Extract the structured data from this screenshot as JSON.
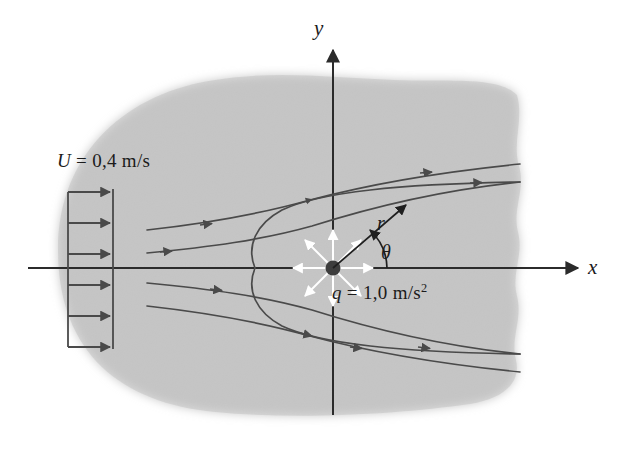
{
  "figure": {
    "kind": "rankine-half-body-potential-flow-diagram",
    "background_color": "#ffffff",
    "blob_color": "#c9c9c9",
    "line_color": "#4a4a4a",
    "axis_color": "#2b2b2b",
    "source_marker_color": "#3d3d3d",
    "source_arrow_color": "#ffffff"
  },
  "labels": {
    "freestream": "U = 0,4 m/s",
    "freestream_symbol": "U",
    "freestream_value": "0,4 m/s",
    "source_strength_symbol": "q",
    "source_strength_value": "1,0 m/s",
    "source_strength_exponent": "2",
    "x_axis": "x",
    "y_axis": "y",
    "radius": "r",
    "angle": "θ"
  },
  "chart_data": {
    "type": "line",
    "title": "",
    "xlabel": "x",
    "ylabel": "y",
    "annotations": [
      {
        "name": "freestream-velocity",
        "text": "U = 0,4 m/s",
        "x": 57,
        "y": 150
      },
      {
        "name": "source-strength",
        "text": "q = 1,0 m/s^2",
        "x": 332,
        "y": 281
      },
      {
        "name": "radial-coordinate",
        "text": "r",
        "x": 377,
        "y": 212
      },
      {
        "name": "angular-coordinate",
        "text": "θ",
        "x": 381,
        "y": 241
      }
    ],
    "origin": {
      "x": 333,
      "y": 268
    },
    "source_point": {
      "x": 333,
      "y": 268
    },
    "stagnation_point": {
      "x": 255,
      "y": 268
    },
    "axes": {
      "x_axis": {
        "x1": 28,
        "y1": 268,
        "x2": 580,
        "y2": 268,
        "arrow": "right"
      },
      "y_axis": {
        "x1": 333,
        "y1": 415,
        "x2": 333,
        "y2": 48,
        "arrow": "up"
      }
    },
    "velocity_profile": {
      "box": {
        "left": 68,
        "top": 188,
        "right": 114,
        "bottom": 350
      },
      "arrow_count": 6,
      "arrow_rows_y": [
        192,
        223,
        254,
        285,
        316,
        347
      ]
    },
    "streamlines": [
      {
        "name": "upper-outer-1",
        "points": [
          [
            147,
            230
          ],
          [
            200,
            224
          ],
          [
            250,
            216
          ],
          [
            300,
            204
          ],
          [
            350,
            190
          ],
          [
            410,
            176
          ],
          [
            470,
            168
          ],
          [
            520,
            164
          ]
        ]
      },
      {
        "name": "upper-outer-2",
        "points": [
          [
            147,
            253
          ],
          [
            200,
            249
          ],
          [
            250,
            243
          ],
          [
            300,
            231
          ],
          [
            350,
            213
          ],
          [
            410,
            196
          ],
          [
            470,
            186
          ],
          [
            520,
            182
          ]
        ]
      },
      {
        "name": "upper-dividing",
        "points": [
          [
            255,
            268
          ],
          [
            248,
            250
          ],
          [
            252,
            232
          ],
          [
            268,
            216
          ],
          [
            295,
            204
          ],
          [
            340,
            195
          ],
          [
            400,
            188
          ],
          [
            470,
            184
          ],
          [
            520,
            183
          ]
        ]
      },
      {
        "name": "lower-dividing",
        "points": [
          [
            255,
            268
          ],
          [
            248,
            286
          ],
          [
            252,
            304
          ],
          [
            268,
            320
          ],
          [
            295,
            332
          ],
          [
            340,
            341
          ],
          [
            400,
            348
          ],
          [
            470,
            352
          ],
          [
            520,
            353
          ]
        ]
      },
      {
        "name": "lower-outer-2",
        "points": [
          [
            147,
            283
          ],
          [
            200,
            287
          ],
          [
            250,
            293
          ],
          [
            300,
            305
          ],
          [
            350,
            323
          ],
          [
            410,
            340
          ],
          [
            470,
            350
          ],
          [
            520,
            354
          ]
        ]
      },
      {
        "name": "lower-outer-1",
        "points": [
          [
            147,
            306
          ],
          [
            200,
            312
          ],
          [
            250,
            320
          ],
          [
            300,
            332
          ],
          [
            350,
            346
          ],
          [
            410,
            360
          ],
          [
            470,
            368
          ],
          [
            520,
            372
          ]
        ]
      }
    ],
    "polar_ray": {
      "from": [
        333,
        268
      ],
      "to": [
        408,
        203
      ],
      "angle_deg": 41
    }
  }
}
